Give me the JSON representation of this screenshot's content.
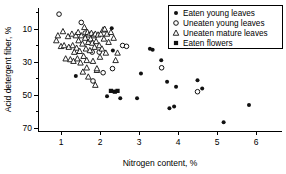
{
  "chart_data": {
    "type": "scatter",
    "title": "",
    "xlabel": "Nitrogen content, %",
    "ylabel": "Acid detergent fiber, %",
    "xlim": [
      0.6,
      6.2
    ],
    "ylim": [
      7,
      82
    ],
    "xticks": [
      1,
      2,
      3,
      4,
      5,
      6
    ],
    "yticks": [
      10,
      30,
      50,
      70
    ],
    "y_minor_ticks": [
      20,
      40,
      60,
      80
    ],
    "grid": false,
    "legend_position": "top-right",
    "series": [
      {
        "name": "Eaten young leaves",
        "marker": "filled-circle",
        "color": "#111111",
        "points": [
          [
            1.38,
            41.5
          ],
          [
            2.18,
            29.2
          ],
          [
            2.3,
            70.5
          ],
          [
            2.33,
            57.0
          ],
          [
            2.52,
            28.0
          ],
          [
            2.95,
            28.0
          ],
          [
            3.05,
            43.0
          ],
          [
            3.28,
            58.0
          ],
          [
            3.35,
            57.5
          ],
          [
            3.57,
            51.0
          ],
          [
            3.72,
            38.0
          ],
          [
            3.78,
            22.0
          ],
          [
            3.9,
            23.0
          ],
          [
            3.95,
            35.0
          ],
          [
            4.5,
            39.0
          ],
          [
            4.62,
            34.0
          ],
          [
            5.17,
            13.5
          ],
          [
            5.82,
            24.0
          ]
        ]
      },
      {
        "name": "Uneaten young leaves",
        "marker": "open-circle",
        "color": "#111111",
        "points": [
          [
            0.95,
            79.0
          ],
          [
            1.52,
            74.0
          ],
          [
            1.62,
            67.5
          ],
          [
            1.72,
            62.0
          ],
          [
            1.8,
            56.0
          ],
          [
            1.82,
            38.5
          ],
          [
            1.98,
            56.0
          ],
          [
            2.08,
            43.5
          ],
          [
            2.32,
            46.0
          ],
          [
            2.58,
            60.0
          ],
          [
            2.68,
            59.5
          ],
          [
            3.58,
            46.5
          ],
          [
            4.5,
            32.0
          ]
        ]
      },
      {
        "name": "Uneaten mature leaves",
        "marker": "open-triangle",
        "color": "#111111",
        "points": [
          [
            0.88,
            63.0
          ],
          [
            0.92,
            66.0
          ],
          [
            1.0,
            59.5
          ],
          [
            1.05,
            68.5
          ],
          [
            1.08,
            60.0
          ],
          [
            1.12,
            52.0
          ],
          [
            1.18,
            65.5
          ],
          [
            1.2,
            59.0
          ],
          [
            1.24,
            51.5
          ],
          [
            1.28,
            67.0
          ],
          [
            1.3,
            60.0
          ],
          [
            1.32,
            50.5
          ],
          [
            1.38,
            66.0
          ],
          [
            1.4,
            58.5
          ],
          [
            1.42,
            52.0
          ],
          [
            1.45,
            63.0
          ],
          [
            1.48,
            56.5
          ],
          [
            1.5,
            49.5
          ],
          [
            1.52,
            66.0
          ],
          [
            1.55,
            61.0
          ],
          [
            1.58,
            53.5
          ],
          [
            1.6,
            71.0
          ],
          [
            1.62,
            64.5
          ],
          [
            1.64,
            58.0
          ],
          [
            1.66,
            51.0
          ],
          [
            1.68,
            68.0
          ],
          [
            1.7,
            62.0
          ],
          [
            1.72,
            66.5
          ],
          [
            1.74,
            57.0
          ],
          [
            1.76,
            64.0
          ],
          [
            1.78,
            67.5
          ],
          [
            1.8,
            61.5
          ],
          [
            1.82,
            50.5
          ],
          [
            1.84,
            66.0
          ],
          [
            1.86,
            59.0
          ],
          [
            1.88,
            67.0
          ],
          [
            1.9,
            62.5
          ],
          [
            1.92,
            45.0
          ],
          [
            1.95,
            66.5
          ],
          [
            1.98,
            60.0
          ],
          [
            2.0,
            53.0
          ],
          [
            2.02,
            67.0
          ],
          [
            2.05,
            58.0
          ],
          [
            2.08,
            69.5
          ],
          [
            2.1,
            64.0
          ],
          [
            2.15,
            55.5
          ],
          [
            2.18,
            67.0
          ],
          [
            2.22,
            62.0
          ],
          [
            2.28,
            68.0
          ],
          [
            2.35,
            64.5
          ],
          [
            1.56,
            44.0
          ],
          [
            1.66,
            46.5
          ],
          [
            1.7,
            41.0
          ],
          [
            1.88,
            36.0
          ],
          [
            1.92,
            46.0
          ],
          [
            2.4,
            51.0
          ],
          [
            2.45,
            55.5
          ],
          [
            1.34,
            56.0
          ],
          [
            1.44,
            68.0
          ],
          [
            2.12,
            70.0
          ]
        ]
      },
      {
        "name": "Eaten flowers",
        "marker": "filled-square",
        "color": "#111111",
        "points": [
          [
            2.28,
            32.5
          ],
          [
            2.38,
            32.0
          ],
          [
            2.45,
            32.5
          ]
        ]
      }
    ]
  },
  "legend": {
    "entries": [
      {
        "label": "Eaten young leaves",
        "marker": "filled-circle"
      },
      {
        "label": "Uneaten young leaves",
        "marker": "open-circle"
      },
      {
        "label": "Uneaten mature leaves",
        "marker": "open-triangle"
      },
      {
        "label": "Eaten flowers",
        "marker": "filled-square"
      }
    ]
  },
  "axes": {
    "x_title": "Nitrogen content, %",
    "y_title": "Acid detergent fiber, %",
    "x_tick_labels": [
      "1",
      "2",
      "3",
      "4",
      "5",
      "6"
    ],
    "y_tick_labels": [
      "70",
      "50",
      "30",
      "10"
    ]
  }
}
